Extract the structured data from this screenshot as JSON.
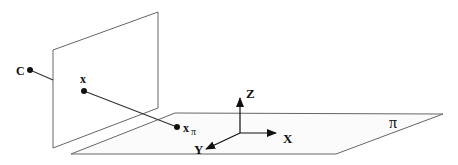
{
  "diagram": {
    "labels": {
      "camera_center": "C",
      "image_point": "x",
      "plane_point": "x",
      "plane_point_subscript": "π",
      "axis_x": "X",
      "axis_y": "Y",
      "axis_z": "Z",
      "plane_name": "π"
    },
    "colors": {
      "stroke": "#555555",
      "ink": "#111111",
      "plane_fill": "#fbfbfb"
    }
  }
}
